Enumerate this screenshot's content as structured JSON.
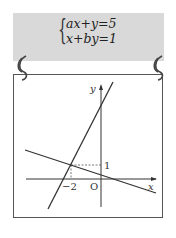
{
  "equations": {
    "line1": "ax+y=5",
    "line2": "x+by=1"
  },
  "graph": {
    "x_axis_label": "x",
    "y_axis_label": "y",
    "origin_label": "O",
    "x_tick_label": "−2",
    "y_tick_label": "1",
    "intersection_point": {
      "x": -2,
      "y": 1
    }
  },
  "colors": {
    "card_bg": "#d9d9d9",
    "line": "#333333",
    "frame": "#555555"
  }
}
